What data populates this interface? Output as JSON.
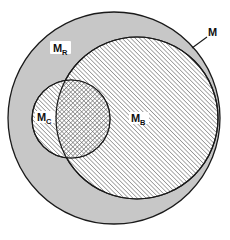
{
  "figure": {
    "type": "set-diagram",
    "title": "",
    "background_color": "#ffffff",
    "width": 230,
    "height": 240
  },
  "colors": {
    "universe_fill": "#c7c7c7",
    "hatch_stroke": "#6b6b6b",
    "outline": "#1a1a1a",
    "label_text": "#111111",
    "label_halo": "#ffffff",
    "page_background": "#ffffff"
  },
  "sets": [
    {
      "id": "M",
      "label": "M",
      "label_sub": "",
      "role": "universe",
      "fill_style": "solid-gray",
      "cx": 114,
      "cy": 118,
      "r": 106,
      "label_x": 212,
      "label_y": 33,
      "leader_line": {
        "x1": 207,
        "y1": 37,
        "x2": 192,
        "y2": 48
      },
      "label_has_halo": false
    },
    {
      "id": "MB",
      "label": "M",
      "label_sub": "B",
      "role": "subset-large",
      "fill_style": "diagonal-hatch",
      "cx": 137,
      "cy": 118,
      "r": 81,
      "label_x": 138,
      "label_y": 122,
      "label_has_halo": true
    },
    {
      "id": "MC",
      "label": "M",
      "label_sub": "C",
      "role": "subset-small",
      "fill_style": "diagonal-hatch",
      "cx": 71,
      "cy": 119,
      "r": 39,
      "label_x": 45,
      "label_y": 121,
      "label_has_halo": true
    },
    {
      "id": "MR",
      "label": "M",
      "label_sub": "R",
      "role": "remainder-annulus",
      "fill_style": "solid-gray",
      "label_x": 60,
      "label_y": 51,
      "label_has_halo": true
    }
  ],
  "regions": [
    {
      "id": "MB-cap-MC",
      "description": "intersection of MB and MC",
      "fill_style": "cross-hatch"
    }
  ],
  "legend_note": ""
}
